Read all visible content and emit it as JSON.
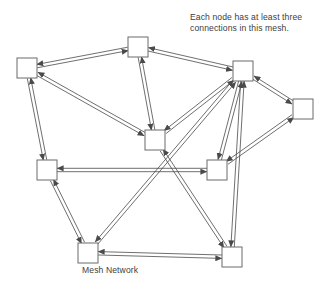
{
  "diagram": {
    "title": "Mesh Network",
    "annotation": {
      "line1": "Each node has at least three",
      "line2": "connections in this mesh."
    },
    "colors": {
      "background": "#ffffff",
      "node_fill": "#ffffff",
      "node_stroke": "#6b6b6b",
      "edge_stroke": "#4a4a4a",
      "text": "#404040"
    },
    "nodes": [
      {
        "id": "n1",
        "label": "",
        "x": 27,
        "y": 68,
        "w": 20,
        "h": 20
      },
      {
        "id": "n2",
        "label": "",
        "x": 138,
        "y": 47,
        "w": 20,
        "h": 20
      },
      {
        "id": "n3",
        "label": "",
        "x": 243,
        "y": 71,
        "w": 20,
        "h": 20
      },
      {
        "id": "n4",
        "label": "",
        "x": 303,
        "y": 109,
        "w": 20,
        "h": 20
      },
      {
        "id": "n5",
        "label": "",
        "x": 155,
        "y": 140,
        "w": 20,
        "h": 20
      },
      {
        "id": "n6",
        "label": "",
        "x": 217,
        "y": 170,
        "w": 20,
        "h": 20
      },
      {
        "id": "n7",
        "label": "",
        "x": 47,
        "y": 170,
        "w": 20,
        "h": 20
      },
      {
        "id": "n8",
        "label": "",
        "x": 88,
        "y": 253,
        "w": 20,
        "h": 20
      },
      {
        "id": "n9",
        "label": "",
        "x": 232,
        "y": 257,
        "w": 20,
        "h": 20
      }
    ],
    "edges": [
      {
        "from": "n1",
        "to": "n2",
        "bidirectional": true
      },
      {
        "from": "n1",
        "to": "n5",
        "bidirectional": true
      },
      {
        "from": "n1",
        "to": "n7",
        "bidirectional": true
      },
      {
        "from": "n2",
        "to": "n5",
        "bidirectional": true
      },
      {
        "from": "n2",
        "to": "n3",
        "bidirectional": true
      },
      {
        "from": "n3",
        "to": "n4",
        "bidirectional": true
      },
      {
        "from": "n3",
        "to": "n5",
        "bidirectional": true
      },
      {
        "from": "n3",
        "to": "n6",
        "bidirectional": true
      },
      {
        "from": "n3",
        "to": "n8",
        "bidirectional": true
      },
      {
        "from": "n4",
        "to": "n6",
        "bidirectional": true
      },
      {
        "from": "n5",
        "to": "n9",
        "bidirectional": true
      },
      {
        "from": "n6",
        "to": "n7",
        "bidirectional": true
      },
      {
        "from": "n7",
        "to": "n8",
        "bidirectional": true
      },
      {
        "from": "n8",
        "to": "n9",
        "bidirectional": true
      },
      {
        "from": "n9",
        "to": "n3",
        "bidirectional": true
      }
    ],
    "node_count": 9,
    "min_connections": 3
  }
}
